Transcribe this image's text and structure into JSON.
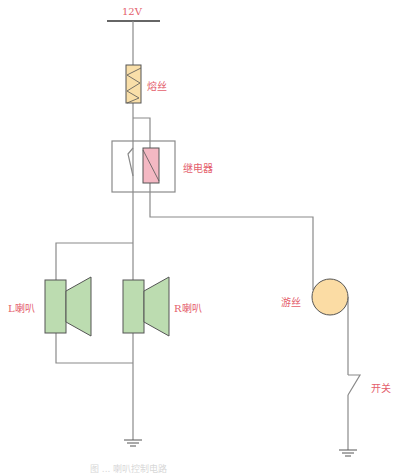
{
  "diagram": {
    "type": "circuit",
    "labels": {
      "supply": "12V",
      "fuse": "熔丝",
      "relay": "继电器",
      "left_speaker": "L喇叭",
      "right_speaker": "R喇叭",
      "hairspring": "游丝",
      "switch": "开关"
    },
    "colors": {
      "wire": "#8a8a8a",
      "label": "#e4606c",
      "fuse_fill": "#f9dfa9",
      "relay_coil_fill": "#f4b8c3",
      "speaker_fill": "#bcdcb0",
      "hairspring_fill": "#fbdca4"
    },
    "caption": "图 ... 喇叭控制电路"
  }
}
